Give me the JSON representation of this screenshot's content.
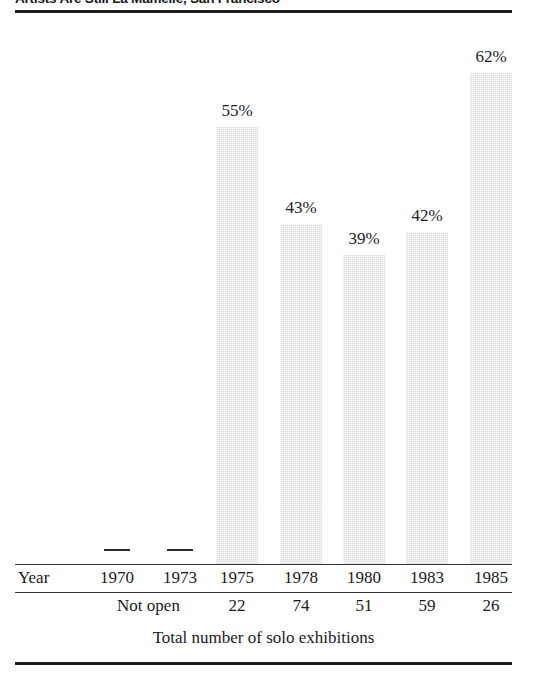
{
  "figure": {
    "title": "Artists Are Still La Mamelle, San Francisco",
    "caption": "Total number of solo exhibitions",
    "row_header": "Year",
    "not_open_label": "Not open"
  },
  "chart_data": {
    "type": "bar",
    "title": "Artists Are Still La Mamelle, San Francisco",
    "xlabel": "Year",
    "ylabel": "",
    "ylim": [
      0,
      70
    ],
    "grid": false,
    "legend": false,
    "categories": [
      "1970",
      "1973",
      "1975",
      "1978",
      "1980",
      "1983",
      "1985"
    ],
    "values": [
      null,
      null,
      55,
      43,
      39,
      42,
      62
    ],
    "value_labels": [
      "—",
      "—",
      "55%",
      "43%",
      "39%",
      "42%",
      "62%"
    ],
    "secondary_row": {
      "label": "Total number of solo exhibitions",
      "values": [
        "Not open",
        "Not open",
        "22",
        "74",
        "51",
        "59",
        "26"
      ]
    }
  },
  "bars": [
    {
      "year": "1970",
      "label": "—",
      "value": null,
      "x": 117,
      "bar_left": 96,
      "top": null,
      "height": 0,
      "has_bar": false
    },
    {
      "year": "1973",
      "label": "—",
      "value": null,
      "x": 180,
      "bar_left": 159,
      "top": null,
      "height": 0,
      "has_bar": false
    },
    {
      "year": "1975",
      "label": "55%",
      "value": 55,
      "x": 237,
      "bar_left": 216,
      "top": 127,
      "height": 438,
      "has_bar": true
    },
    {
      "year": "1978",
      "label": "43%",
      "value": 43,
      "x": 301,
      "bar_left": 280,
      "top": 224,
      "height": 341,
      "has_bar": true
    },
    {
      "year": "1980",
      "label": "39%",
      "value": 39,
      "x": 364,
      "bar_left": 343,
      "top": 255,
      "height": 310,
      "has_bar": true
    },
    {
      "year": "1983",
      "label": "42%",
      "value": 42,
      "x": 427,
      "bar_left": 406,
      "top": 232,
      "height": 333,
      "has_bar": true
    },
    {
      "year": "1985",
      "label": "62%",
      "value": 62,
      "x": 491,
      "bar_left": 470,
      "top": 73,
      "height": 492,
      "has_bar": true
    }
  ],
  "counts": [
    {
      "year": "1975",
      "value": "22",
      "x": 237
    },
    {
      "year": "1978",
      "value": "74",
      "x": 301
    },
    {
      "year": "1980",
      "value": "51",
      "x": 364
    },
    {
      "year": "1983",
      "value": "59",
      "x": 427
    },
    {
      "year": "1985",
      "value": "26",
      "x": 491
    }
  ],
  "colors": {
    "bar_fill": "#dedede",
    "rule": "#1d1d1d",
    "text": "#1a1a1a",
    "background": "#ffffff"
  }
}
